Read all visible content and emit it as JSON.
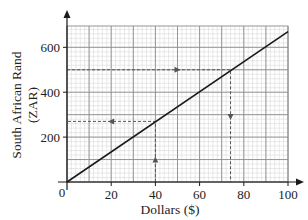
{
  "chart_data": {
    "type": "line",
    "title": "",
    "xlabel": "Dollars ($)",
    "ylabel_line1": "South African Rand",
    "ylabel_line2": "(ZAR)",
    "xlim": [
      0,
      100
    ],
    "ylim": [
      0,
      695
    ],
    "x_ticks": [
      0,
      20,
      40,
      60,
      80,
      100
    ],
    "x_tick_labels": [
      "0",
      "20",
      "40",
      "60",
      "80",
      "100"
    ],
    "y_ticks": [
      200,
      400,
      600
    ],
    "y_tick_labels": [
      "200",
      "400",
      "600"
    ],
    "origin_label": "0",
    "grid": true,
    "grid_major": {
      "x_step": 10,
      "y_step": 100
    },
    "grid_minor": {
      "x_step": 2,
      "y_step": 20
    },
    "series": [
      {
        "name": "Conversion line",
        "x": [
          0,
          100
        ],
        "y": [
          0,
          670
        ],
        "color": "#1a1a1a"
      }
    ],
    "annotations": [
      {
        "name": "dollars-to-rand",
        "description": "Vertical dashed from $40 up to line, then horizontal dashed left to ~270 ZAR",
        "path": [
          [
            40,
            0
          ],
          [
            40,
            270
          ],
          [
            0,
            270
          ]
        ],
        "arrows": [
          {
            "at": [
              40,
              100
            ],
            "direction": "up"
          },
          {
            "at": [
              20,
              270
            ],
            "direction": "left"
          }
        ]
      },
      {
        "name": "rand-to-dollars",
        "description": "Horizontal dashed from 500 ZAR right to line, then vertical dashed down to ~$74",
        "path": [
          [
            0,
            500
          ],
          [
            74,
            500
          ],
          [
            74,
            0
          ]
        ],
        "arrows": [
          {
            "at": [
              50,
              500
            ],
            "direction": "right"
          },
          {
            "at": [
              74,
              290
            ],
            "direction": "down"
          }
        ]
      }
    ]
  },
  "colors": {
    "axis": "#1a1a1a",
    "grid_major": "#8c8c8c",
    "grid_minor": "#d2d2d2",
    "line": "#1a1a1a",
    "dashed": "#555555"
  }
}
